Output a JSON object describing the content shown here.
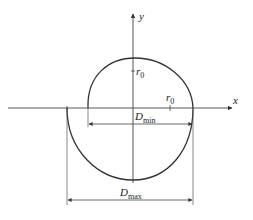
{
  "diagram": {
    "axes": {
      "x_label": "x",
      "y_label": "y"
    },
    "radius_labels": {
      "vertical": {
        "symbol": "r",
        "subscript": "0"
      },
      "horizontal": {
        "symbol": "r",
        "subscript": "0"
      }
    },
    "dimensions": {
      "min": {
        "symbol": "D",
        "subscript": "min"
      },
      "max": {
        "symbol": "D",
        "subscript": "max"
      }
    },
    "colors": {
      "line": "#333333",
      "background": "#ffffff"
    }
  }
}
